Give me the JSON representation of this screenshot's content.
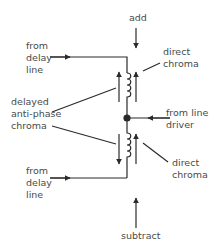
{
  "diagram": {
    "type": "delay-line adder/subtractor transformer circuit",
    "labels": {
      "add": "add",
      "subtract": "subtract",
      "from_delay_line_top": [
        "from",
        "delay",
        "line"
      ],
      "from_delay_line_bottom": [
        "from",
        "delay",
        "line"
      ],
      "direct_chroma_top": [
        "direct",
        "chroma"
      ],
      "direct_chroma_bottom": [
        "direct",
        "chroma"
      ],
      "delayed_antiphase_chroma": [
        "delayed",
        "anti-phase",
        "chroma"
      ],
      "from_line_driver": [
        "from line",
        "driver"
      ]
    },
    "colors": {
      "line": "#2a2a2a",
      "text": "#4a4a4a",
      "background": "#ffffff"
    }
  }
}
